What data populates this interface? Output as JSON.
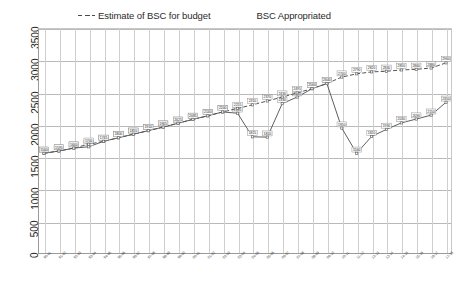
{
  "chart_data": {
    "type": "line",
    "title": "",
    "xlabel": "",
    "ylabel": "",
    "ylim": [
      0,
      3500
    ],
    "ytick_step": 500,
    "yticks": [
      "0",
      "500",
      "1000",
      "1500",
      "2000",
      "2500",
      "3000",
      "3500"
    ],
    "grid": true,
    "legend_position": "top",
    "categories": [
      "90-91",
      "91-92",
      "92-93",
      "93-94",
      "94-95",
      "95-96",
      "96-97",
      "97-98",
      "98-99",
      "99-00",
      "00-01",
      "01-02",
      "02-03",
      "03-04",
      "04-05",
      "05-06",
      "06-07",
      "07-08",
      "08-09",
      "09-10",
      "10-11",
      "11-12",
      "12-13",
      "13-14",
      "14-15",
      "15-16",
      "16-17",
      "17-18"
    ],
    "series": [
      {
        "name": "Estimate of BSC for budget",
        "style": "dashed",
        "color": "#555555",
        "values": [
          1560,
          1595,
          1640,
          1700,
          1745,
          1800,
          1855,
          1910,
          1965,
          2025,
          2085,
          2140,
          2200,
          2255,
          2310,
          2370,
          2430,
          2495,
          2560,
          2640,
          2740,
          2790,
          2820,
          2830,
          2850,
          2860,
          2880,
          2960
        ]
      },
      {
        "name": "BSC Appropriated",
        "style": "solid",
        "color": "#5f5f5f",
        "values": [
          1560,
          1595,
          1640,
          1660,
          1745,
          1800,
          1855,
          1910,
          1965,
          2025,
          2085,
          2140,
          2200,
          2180,
          1815,
          1810,
          2330,
          2430,
          2560,
          2640,
          1950,
          1560,
          1820,
          1930,
          2030,
          2090,
          2150,
          2350
        ]
      }
    ]
  },
  "legend": {
    "entries": [
      {
        "label": "Estimate of BSC for budget",
        "marker": "dashed-line-marker"
      },
      {
        "label": "BSC Appropriated",
        "marker": "solid-line-marker"
      }
    ]
  }
}
